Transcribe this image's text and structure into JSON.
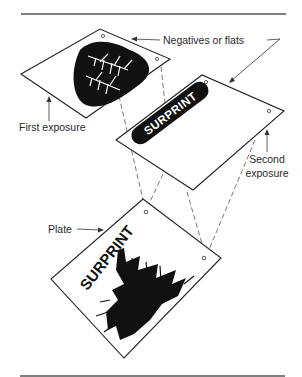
{
  "figure": {
    "labels": {
      "negatives": "Negatives or flats",
      "first_exposure": "First exposure",
      "second_exposure_line1": "Second",
      "second_exposure_line2": "exposure",
      "plate": "Plate"
    },
    "surprint_text": "SURPRINT",
    "elements": [
      {
        "name": "first-negative",
        "description": "Negative sheet with black blob containing white tree image"
      },
      {
        "name": "second-negative",
        "description": "Negative sheet with black pill containing white SURPRINT text"
      },
      {
        "name": "plate",
        "description": "Plate showing combined SURPRINT text over dark tree image"
      }
    ],
    "colors": {
      "ink": "#111111",
      "paper": "#ffffff",
      "rule": "#555555"
    }
  }
}
